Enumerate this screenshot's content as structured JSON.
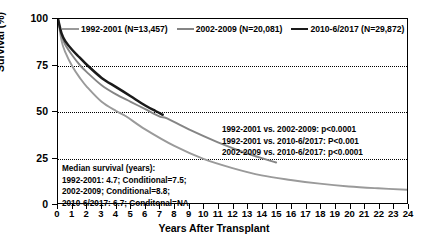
{
  "chart_data": {
    "type": "line",
    "title": "",
    "xlabel": "Years After Transplant",
    "ylabel": "Survival (%)",
    "xlim": [
      0,
      24
    ],
    "ylim": [
      0,
      100
    ],
    "xticks": [
      0,
      1,
      2,
      3,
      4,
      5,
      6,
      7,
      8,
      9,
      10,
      11,
      12,
      13,
      14,
      15,
      16,
      17,
      18,
      19,
      20,
      21,
      22,
      23,
      24
    ],
    "yticks": [
      0,
      25,
      50,
      75,
      100
    ],
    "grid": "horizontal-dotted at 25, 50, 75",
    "legend_position": "top-inside",
    "series": [
      {
        "name": "1992-2001 (N=13,457)",
        "color": "#9a9a9a",
        "x": [
          0,
          0.25,
          0.5,
          1,
          1.5,
          2,
          3,
          4,
          4.7,
          6,
          8,
          10,
          12,
          14,
          16,
          18,
          20,
          22,
          24
        ],
        "values": [
          100,
          88,
          82,
          74,
          68,
          63,
          55,
          50,
          47,
          40,
          31,
          24,
          19,
          15,
          12.5,
          10.5,
          9,
          8,
          7.2
        ]
      },
      {
        "name": "2002-2009 (N=20,081)",
        "color": "#858585",
        "x": [
          0,
          0.25,
          0.5,
          1,
          1.5,
          2,
          3,
          4,
          5,
          6,
          7,
          7.5,
          9,
          11,
          13,
          15
        ],
        "values": [
          100,
          91,
          86,
          80,
          75,
          71,
          64,
          59,
          55,
          51,
          47,
          46,
          40,
          33,
          27,
          22
        ]
      },
      {
        "name": "2010-6/2017 (N=29,872)",
        "color": "#1a1a1a",
        "x": [
          0,
          0.25,
          0.5,
          1,
          1.5,
          2,
          3,
          4,
          5,
          6,
          6.7,
          7.2
        ],
        "values": [
          100,
          92,
          88,
          83,
          79,
          75,
          68,
          63,
          58,
          53,
          50,
          48
        ]
      }
    ],
    "annotations": {
      "pvalues": [
        "1992-2001 vs. 2002-2009: p<0.0001",
        "1992-2001 vs. 2010-6/2017: P<0.001",
        "2002-2009 vs. 2010-6/2017: p<0.0001"
      ],
      "median_survival": [
        "Median survival (years):",
        "1992-2001: 4.7; Conditional=7.5;",
        "2002-2009; Conditional=8.8;",
        "2010-6/2017: 6.7; Conditonal=NA"
      ]
    }
  }
}
